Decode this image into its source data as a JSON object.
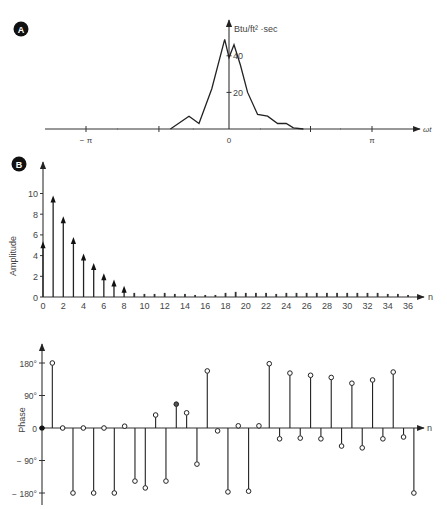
{
  "panels": {
    "a": {
      "badge": "A",
      "y_unit_label": "Btu/ft² ·sec",
      "x_label": "ωt",
      "y_ticks": [
        {
          "value": 20,
          "label": "20"
        },
        {
          "value": 40,
          "label": "40"
        }
      ],
      "x_ticks": [
        {
          "pi": -1,
          "label": "− π"
        },
        {
          "pi": -0.49,
          "label": ""
        },
        {
          "pi": 0,
          "label": "0"
        },
        {
          "pi": 0.57,
          "label": ""
        },
        {
          "pi": 1,
          "label": "π"
        }
      ]
    },
    "b": {
      "badge": "B",
      "amplitude_ylabel": "Amplitude",
      "phase_ylabel": "Phase",
      "n_label": "n",
      "amplitude_yticks": [
        "0",
        "2",
        "4",
        "6",
        "8",
        "10"
      ],
      "phase_yticks": [
        {
          "value": 180,
          "label": "180°"
        },
        {
          "value": 90,
          "label": "90°"
        },
        {
          "value": 0,
          "label": "0"
        },
        {
          "value": -90,
          "label": "− 90°"
        },
        {
          "value": -180,
          "label": "− 180°"
        }
      ],
      "n_ticklabels": [
        "0",
        "2",
        "4",
        "6",
        "8",
        "10",
        "12",
        "14",
        "16",
        "18",
        "20",
        "22",
        "24",
        "26",
        "28",
        "30",
        "32",
        "34",
        "36"
      ]
    }
  },
  "chart_data": [
    {
      "type": "line",
      "title": "A",
      "xlabel": "ωt",
      "ylabel": "Btu/ft² ·sec",
      "x_unit": "π radians",
      "xlim": [
        -1.3,
        1.35
      ],
      "ylim": [
        0,
        50
      ],
      "x": [
        -0.41,
        -0.28,
        -0.21,
        -0.12,
        -0.03,
        0.0,
        0.035,
        0.08,
        0.13,
        0.2,
        0.27,
        0.34,
        0.4,
        0.45,
        0.52
      ],
      "y": [
        0,
        7,
        3,
        22,
        49,
        39,
        46,
        35,
        20,
        8,
        7,
        3,
        3,
        0.6,
        0
      ],
      "x_ticks": [
        "−π",
        "0",
        "π"
      ],
      "y_ticks": [
        20,
        40
      ]
    },
    {
      "type": "bar",
      "title": "B – Amplitude spectrum",
      "xlabel": "n",
      "ylabel": "Amplitude",
      "ylim": [
        0,
        12
      ],
      "categories": [
        0,
        1,
        2,
        3,
        4,
        5,
        6,
        7,
        8,
        9,
        10,
        11,
        12,
        13,
        14,
        15,
        16,
        17,
        18,
        19,
        20,
        21,
        22,
        23,
        24,
        25,
        26,
        27,
        28,
        29,
        30,
        31,
        32,
        33,
        34,
        35,
        36
      ],
      "values": [
        5.3,
        9.7,
        7.7,
        5.7,
        4.1,
        3.2,
        2.2,
        1.6,
        1.0,
        0.3,
        0.2,
        0.2,
        0.3,
        0.2,
        0.2,
        0.1,
        0.1,
        0.1,
        0.3,
        0.4,
        0.3,
        0.3,
        0.3,
        0.2,
        0.3,
        0.3,
        0.3,
        0.3,
        0.3,
        0.3,
        0.3,
        0.3,
        0.3,
        0.3,
        0.2,
        0.2,
        0.1
      ]
    },
    {
      "type": "scatter",
      "title": "B – Phase spectrum",
      "xlabel": "n",
      "ylabel": "Phase",
      "ylim": [
        -180,
        180
      ],
      "categories": [
        0,
        1,
        2,
        3,
        4,
        5,
        6,
        7,
        8,
        9,
        10,
        11,
        12,
        13,
        14,
        15,
        16,
        17,
        18,
        19,
        20,
        21,
        22,
        23,
        24,
        25,
        26,
        27,
        28,
        29,
        30,
        31,
        32,
        33,
        34,
        35,
        36
      ],
      "values": [
        0,
        180,
        0,
        -180,
        0,
        -180,
        0,
        -180,
        5,
        -147,
        -166,
        36,
        -147,
        66,
        42,
        -100,
        158,
        -8,
        -177,
        6,
        -175,
        6,
        178,
        -30,
        152,
        -28,
        146,
        -30,
        140,
        -50,
        124,
        -55,
        133,
        -30,
        155,
        -25,
        -180
      ],
      "y_ticks": [
        "180°",
        "90°",
        "0",
        "−90°",
        "−180°"
      ]
    }
  ]
}
